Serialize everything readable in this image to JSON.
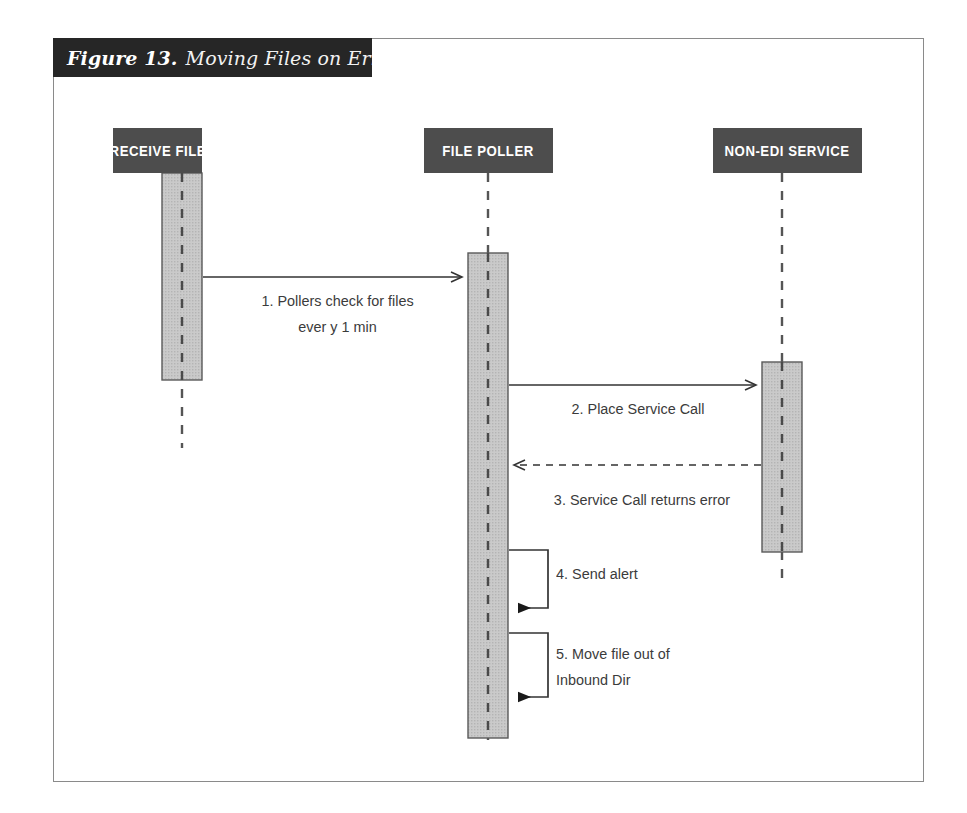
{
  "figure": {
    "number_label": "Figure 13.",
    "title": "Moving Files on Error"
  },
  "diagram": {
    "type": "uml-sequence-diagram",
    "colors": {
      "frame_border": "#8a8a8a",
      "caption_background": "#262626",
      "caption_text": "#ffffff",
      "actor_header_background": "#4d4d4d",
      "actor_header_text": "#ffffff",
      "activation_fill": "#c9c9c9",
      "activation_border": "#5a5a5a",
      "lifeline": "#555555",
      "arrow": "#333333",
      "label_text": "#3b3b3b"
    },
    "actors": [
      {
        "id": "receive-file",
        "label": "RECEIVE FILE",
        "lifeline_x": 182
      },
      {
        "id": "file-poller",
        "label": "FILE POLLER",
        "lifeline_x": 488
      },
      {
        "id": "non-edi-service",
        "label": "NON-EDI SERVICE",
        "lifeline_x": 782
      }
    ],
    "messages": [
      {
        "number": "1",
        "text": "1. Pollers check for files\never y 1 min",
        "label_lines": [
          "1. Pollers check for files",
          "every 1 min"
        ],
        "from": "receive-file",
        "to": "file-poller",
        "style": "solid",
        "arrowhead": "open",
        "direction": "right",
        "y": 277
      },
      {
        "number": "2",
        "text": "2. Place Service Call",
        "label_lines": [
          "2. Place Service Call"
        ],
        "from": "file-poller",
        "to": "non-edi-service",
        "style": "solid",
        "arrowhead": "open",
        "direction": "right",
        "y": 385
      },
      {
        "number": "3",
        "text": "3. Service Call returns error",
        "label_lines": [
          "3. Service Call returns error"
        ],
        "from": "non-edi-service",
        "to": "file-poller",
        "style": "dashed",
        "arrowhead": "open",
        "direction": "left",
        "y": 465
      },
      {
        "number": "4",
        "text": "4. Send alert",
        "label_lines": [
          "4. Send alert"
        ],
        "from": "file-poller",
        "to": "file-poller",
        "style": "solid",
        "arrowhead": "filled",
        "direction": "self",
        "y": 550
      },
      {
        "number": "5",
        "text": "5. Move file out of Inbound Dir",
        "label_lines": [
          "5. Move file out of",
          "Inbound Dir"
        ],
        "from": "file-poller",
        "to": "file-poller",
        "style": "solid",
        "arrowhead": "filled",
        "direction": "self",
        "y": 633
      }
    ],
    "activations": [
      {
        "actor": "receive-file",
        "top": 173,
        "bottom": 380
      },
      {
        "actor": "file-poller",
        "top": 253,
        "bottom": 738
      },
      {
        "actor": "non-edi-service",
        "top": 362,
        "bottom": 552
      }
    ]
  }
}
